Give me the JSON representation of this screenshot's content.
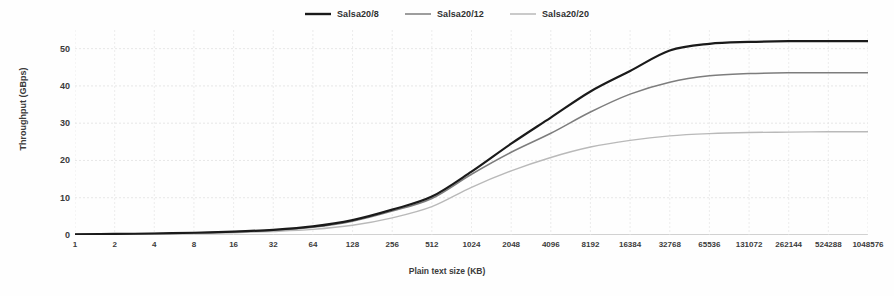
{
  "chart_data": {
    "type": "line",
    "title": "",
    "xlabel": "Plain text size (KB)",
    "ylabel": "Throughput (GBps)",
    "x_scale": "log2-categorical",
    "categories": [
      "1",
      "2",
      "4",
      "8",
      "16",
      "32",
      "64",
      "128",
      "256",
      "512",
      "1024",
      "2048",
      "4096",
      "8192",
      "16384",
      "32768",
      "65536",
      "131072",
      "262144",
      "524288",
      "1048576"
    ],
    "yticks": [
      0,
      10,
      20,
      30,
      40,
      50
    ],
    "ylim": [
      0,
      55
    ],
    "grid": true,
    "legend_position": "top-center",
    "series": [
      {
        "name": "Salsa20/8",
        "color": "#1a1a1a",
        "width": 2.2,
        "values": [
          0.2,
          0.3,
          0.4,
          0.6,
          0.9,
          1.4,
          2.3,
          4.0,
          6.8,
          10.3,
          17.0,
          24.5,
          31.5,
          38.5,
          44.0,
          49.5,
          51.3,
          51.8,
          52.0,
          52.0,
          52.0
        ]
      },
      {
        "name": "Salsa20/12",
        "color": "#7d7d7d",
        "width": 1.5,
        "values": [
          0.2,
          0.3,
          0.4,
          0.55,
          0.85,
          1.3,
          2.1,
          3.7,
          6.4,
          9.8,
          16.3,
          22.2,
          27.3,
          33.0,
          37.8,
          41.0,
          42.7,
          43.3,
          43.5,
          43.5,
          43.5
        ]
      },
      {
        "name": "Salsa20/20",
        "color": "#b9b9b9",
        "width": 1.4,
        "values": [
          0.15,
          0.2,
          0.3,
          0.4,
          0.6,
          0.95,
          1.5,
          2.6,
          4.6,
          7.6,
          12.8,
          17.2,
          20.8,
          23.6,
          25.4,
          26.6,
          27.2,
          27.5,
          27.6,
          27.7,
          27.7
        ]
      }
    ]
  },
  "legend": {
    "entries": [
      {
        "label": "Salsa20/8"
      },
      {
        "label": "Salsa20/12"
      },
      {
        "label": "Salsa20/20"
      }
    ]
  }
}
